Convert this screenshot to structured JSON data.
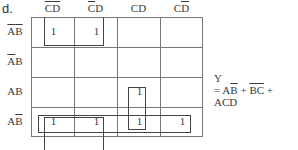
{
  "figure_label": "d.",
  "columns": [
    {
      "c": "C",
      "c_bar": true,
      "d": "D",
      "d_bar": true
    },
    {
      "c": "C",
      "c_bar": true,
      "d": "D",
      "d_bar": false
    },
    {
      "c": "C",
      "c_bar": false,
      "d": "D",
      "d_bar": false
    },
    {
      "c": "C",
      "c_bar": false,
      "d": "D",
      "d_bar": true
    }
  ],
  "rows": [
    {
      "a": "A",
      "a_bar": true,
      "b": "B",
      "b_bar": true
    },
    {
      "a": "A",
      "a_bar": true,
      "b": "B",
      "b_bar": false
    },
    {
      "a": "A",
      "a_bar": false,
      "b": "B",
      "b_bar": false
    },
    {
      "a": "A",
      "a_bar": false,
      "b": "B",
      "b_bar": true
    }
  ],
  "cells": [
    [
      "1",
      "1",
      "",
      ""
    ],
    [
      "",
      "",
      "",
      ""
    ],
    [
      "",
      "",
      "1",
      ""
    ],
    [
      "1",
      "1",
      "1",
      "1"
    ]
  ],
  "groupings": [
    {
      "name": "group-bc-bar",
      "rows": [
        0
      ],
      "cols": [
        0,
        1
      ],
      "wraps": true
    },
    {
      "name": "group-ab-bar",
      "rows": [
        3
      ],
      "cols": [
        0,
        1,
        2,
        3
      ]
    },
    {
      "name": "group-acd",
      "rows": [
        2,
        3
      ],
      "cols": [
        2
      ]
    }
  ],
  "output": {
    "var": "Y",
    "eq": "=",
    "terms": [
      {
        "parts": [
          {
            "t": "A",
            "bar": false
          },
          {
            "t": "B",
            "bar": true
          }
        ]
      },
      {
        "parts": [
          {
            "t": "BC",
            "bar": true
          }
        ]
      },
      {
        "parts": [
          {
            "t": "ACD",
            "bar": false
          }
        ]
      }
    ],
    "plus": "+"
  }
}
